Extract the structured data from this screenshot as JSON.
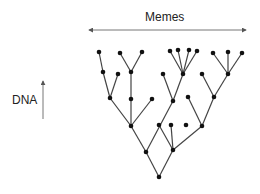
{
  "labels": {
    "horizontal_axis": "Memes",
    "vertical_axis": "DNA"
  },
  "colors": {
    "edge": "#444444",
    "node": "#111111",
    "axis_arrow": "#666666",
    "text": "#222222"
  },
  "axes": {
    "horizontal_arrow": {
      "x1": 89,
      "y1": 30,
      "x2": 246,
      "y2": 30,
      "double_headed": true
    },
    "vertical_arrow": {
      "x1": 43,
      "y1": 119,
      "x2": 43,
      "y2": 81,
      "double_headed": false
    }
  },
  "tree": {
    "nodes": [
      {
        "id": "root",
        "x": 159,
        "y": 177
      },
      {
        "id": "L1",
        "x": 146,
        "y": 152
      },
      {
        "id": "R1",
        "x": 173,
        "y": 150
      },
      {
        "id": "L2",
        "x": 131,
        "y": 126
      },
      {
        "id": "L2b",
        "x": 159,
        "y": 125
      },
      {
        "id": "R2a",
        "x": 171,
        "y": 125
      },
      {
        "id": "R2b",
        "x": 186,
        "y": 125
      },
      {
        "id": "R2",
        "x": 202,
        "y": 126
      },
      {
        "id": "a1",
        "x": 110,
        "y": 98
      },
      {
        "id": "a2",
        "x": 131,
        "y": 99
      },
      {
        "id": "a3",
        "x": 152,
        "y": 99
      },
      {
        "id": "b1",
        "x": 173,
        "y": 101
      },
      {
        "id": "c1",
        "x": 188,
        "y": 97
      },
      {
        "id": "c2",
        "x": 214,
        "y": 97
      },
      {
        "id": "d1",
        "x": 103,
        "y": 72
      },
      {
        "id": "d2",
        "x": 118,
        "y": 74
      },
      {
        "id": "d3",
        "x": 131,
        "y": 72
      },
      {
        "id": "e1",
        "x": 163,
        "y": 74
      },
      {
        "id": "e2",
        "x": 183,
        "y": 74
      },
      {
        "id": "f1",
        "x": 202,
        "y": 74
      },
      {
        "id": "f2",
        "x": 228,
        "y": 74
      },
      {
        "id": "g1",
        "x": 99,
        "y": 52
      },
      {
        "id": "g2",
        "x": 120,
        "y": 53
      },
      {
        "id": "g3",
        "x": 142,
        "y": 52
      },
      {
        "id": "h1",
        "x": 170,
        "y": 51
      },
      {
        "id": "h2",
        "x": 178,
        "y": 50
      },
      {
        "id": "h3",
        "x": 189,
        "y": 50
      },
      {
        "id": "h4",
        "x": 197,
        "y": 51
      },
      {
        "id": "i1",
        "x": 213,
        "y": 53
      },
      {
        "id": "i2",
        "x": 228,
        "y": 52
      },
      {
        "id": "i3",
        "x": 242,
        "y": 53
      }
    ],
    "edges": [
      [
        "root",
        "L1"
      ],
      [
        "root",
        "R1"
      ],
      [
        "L1",
        "L2"
      ],
      [
        "L1",
        "b1"
      ],
      [
        "R1",
        "L2b"
      ],
      [
        "R1",
        "R2a"
      ],
      [
        "R1",
        "R2"
      ],
      [
        "L2",
        "a1"
      ],
      [
        "L2",
        "a2"
      ],
      [
        "L2",
        "a3"
      ],
      [
        "a1",
        "d1"
      ],
      [
        "a1",
        "d2"
      ],
      [
        "d1",
        "g1"
      ],
      [
        "a2",
        "d3"
      ],
      [
        "d3",
        "g2"
      ],
      [
        "d3",
        "g3"
      ],
      [
        "b1",
        "e1"
      ],
      [
        "b1",
        "e2"
      ],
      [
        "e2",
        "h1"
      ],
      [
        "e2",
        "h2"
      ],
      [
        "e2",
        "h3"
      ],
      [
        "e2",
        "h4"
      ],
      [
        "R2",
        "c1"
      ],
      [
        "R2",
        "c2"
      ],
      [
        "c2",
        "f1"
      ],
      [
        "c2",
        "f2"
      ],
      [
        "f2",
        "i1"
      ],
      [
        "f2",
        "i2"
      ],
      [
        "f2",
        "i3"
      ]
    ]
  }
}
